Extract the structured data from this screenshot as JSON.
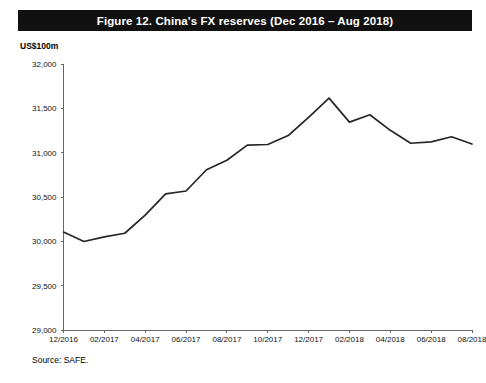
{
  "figure": {
    "title": "Figure 12.  China's FX reserves (Dec 2016 – Aug 2018)",
    "unit_label": "US$100m",
    "source": "Source:   SAFE."
  },
  "chart_data": {
    "type": "line",
    "title": "Figure 12.  China's FX reserves (Dec 2016 – Aug 2018)",
    "xlabel": "",
    "ylabel": "US$100m",
    "ylim": [
      29000,
      32000
    ],
    "yticks": [
      29000,
      29500,
      30000,
      30500,
      31000,
      31500,
      32000
    ],
    "ytick_labels": [
      "29,000",
      "29,500",
      "30,000",
      "30,500",
      "31,000",
      "31,500",
      "32,000"
    ],
    "xtick_labels": [
      "12/2016",
      "02/2017",
      "04/2017",
      "06/2017",
      "08/2017",
      "10/2017",
      "12/2017",
      "02/2018",
      "04/2018",
      "06/2018",
      "08/2018"
    ],
    "grid": false,
    "legend": "none",
    "series": [
      {
        "name": "China's FX reserves",
        "color": "#262626",
        "x": [
          "12/2016",
          "01/2017",
          "02/2017",
          "03/2017",
          "04/2017",
          "05/2017",
          "06/2017",
          "07/2017",
          "08/2017",
          "09/2017",
          "10/2017",
          "11/2017",
          "12/2017",
          "01/2018",
          "02/2018",
          "03/2018",
          "04/2018",
          "05/2018",
          "06/2018",
          "07/2018",
          "08/2018"
        ],
        "values": [
          30105,
          29998,
          30051,
          30091,
          30295,
          30535,
          30568,
          30807,
          30915,
          31085,
          31092,
          31193,
          31399,
          31615,
          31345,
          31428,
          31252,
          31106,
          31121,
          31179,
          31097
        ]
      }
    ]
  }
}
